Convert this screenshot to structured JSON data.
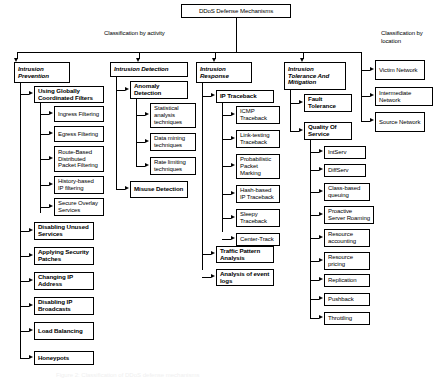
{
  "diagram": {
    "title": "DDoS Defense Mechanisms",
    "caption": "Figure 2: Classification of DDoS defense mechanisms",
    "labels": {
      "by_activity": "Classification by activity",
      "by_location": "Classification by location"
    },
    "branches": [
      {
        "id": "intrusion-prevention",
        "title": "Intrusion Prevention",
        "children": [
          {
            "id": "using-globally-coordinated-filters",
            "title": "Using Globally Coordinated Filters",
            "children": [
              {
                "id": "ingress-filtering",
                "title": "Ingress Filtering"
              },
              {
                "id": "egress-filtering",
                "title": "Egress Filtering"
              },
              {
                "id": "route-based-distributed-packet-filtering",
                "title": "Route-Based Distributed Packet Filtering"
              },
              {
                "id": "history-based-ip-filtering",
                "title": "History-based IP filtering"
              },
              {
                "id": "secure-overlay-services",
                "title": "Secure Overlay Services"
              }
            ]
          },
          {
            "id": "disabling-unused-services",
            "title": "Disabling Unused Services",
            "children": []
          },
          {
            "id": "applying-security-patches",
            "title": "Applying Security Patches",
            "children": []
          },
          {
            "id": "changing-ip-address",
            "title": "Changing IP Address",
            "children": []
          },
          {
            "id": "disabling-ip-broadcasts",
            "title": "Disabling IP Broadcasts",
            "children": []
          },
          {
            "id": "load-balancing",
            "title": "Load Balancing",
            "children": []
          },
          {
            "id": "honeypots",
            "title": "Honeypots",
            "children": []
          }
        ]
      },
      {
        "id": "intrusion-detection",
        "title": "Intrusion Detection",
        "children": [
          {
            "id": "anomaly-detection",
            "title": "Anomaly Detection",
            "children": [
              {
                "id": "statistical-analysis-techniques",
                "title": "Statistical analysis techniques"
              },
              {
                "id": "data-mining-techniques",
                "title": "Data mining techniques"
              },
              {
                "id": "rate-limiting-techniques",
                "title": "Rate limiting techniques"
              }
            ]
          },
          {
            "id": "misuse-detection",
            "title": "Misuse Detection",
            "children": []
          }
        ]
      },
      {
        "id": "intrusion-response",
        "title": "Intrusion Response",
        "children": [
          {
            "id": "ip-traceback",
            "title": "IP Traceback",
            "children": [
              {
                "id": "icmp-traceback",
                "title": "ICMP Traceback"
              },
              {
                "id": "link-testing-traceback",
                "title": "Link-testing Traceback"
              },
              {
                "id": "probabilistic-packet-marking",
                "title": "Probabilistic Packet Marking"
              },
              {
                "id": "hash-based-ip-traceback",
                "title": "Hash-based IP Traceback"
              },
              {
                "id": "sleepy-traceback",
                "title": "Sleepy Traceback"
              },
              {
                "id": "center-track",
                "title": "Center-Track"
              }
            ]
          },
          {
            "id": "traffic-pattern-analysis",
            "title": "Traffic Pattern Analysis",
            "children": []
          },
          {
            "id": "analysis-of-event-logs",
            "title": "Analysis of event logs",
            "children": []
          }
        ]
      },
      {
        "id": "intrusion-tolerance-and-mitigation",
        "title": "Intrusion Tolerance And Mitigation",
        "children": [
          {
            "id": "fault-tolerance",
            "title": "Fault Tolerance",
            "children": []
          },
          {
            "id": "quality-of-service",
            "title": "Quality Of Service",
            "children": [
              {
                "id": "intserv",
                "title": "IntServ"
              },
              {
                "id": "diffserv",
                "title": "DiffServ"
              },
              {
                "id": "class-based-queuing",
                "title": "Class-based queuing"
              },
              {
                "id": "proactive-server-roaming",
                "title": "Proactive Server Roaming"
              },
              {
                "id": "resource-accounting",
                "title": "Resource accounting"
              },
              {
                "id": "resource-pricing",
                "title": "Resource pricing"
              },
              {
                "id": "replication",
                "title": "Replication"
              },
              {
                "id": "pushback",
                "title": "Pushback"
              },
              {
                "id": "throttling",
                "title": "Throttling"
              }
            ]
          }
        ]
      }
    ],
    "location_nodes": [
      {
        "id": "victim-network",
        "title": "Victim Network"
      },
      {
        "id": "intermediate-network",
        "title": "Intermediate Network"
      },
      {
        "id": "source-network",
        "title": "Source Network"
      }
    ],
    "colors": {
      "line": "#000000",
      "box_border": "#000000",
      "background": "#ffffff",
      "text": "#000000"
    }
  }
}
